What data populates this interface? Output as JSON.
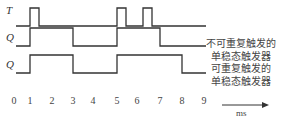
{
  "diagram": {
    "signals": [
      {
        "name": "T",
        "pulses": [
          [
            1,
            1.4
          ],
          [
            5,
            5.4
          ],
          [
            6.2,
            6.6
          ]
        ]
      },
      {
        "name": "Q",
        "pulses": [
          [
            1,
            3
          ],
          [
            5,
            7
          ]
        ],
        "caption": [
          "不可重复触发的",
          "单稳态触发器"
        ]
      },
      {
        "name": "Q",
        "pulses": [
          [
            1,
            3
          ],
          [
            5,
            8
          ]
        ],
        "caption": [
          "可重复触发的",
          "单稳态触发器"
        ]
      }
    ],
    "axis": {
      "ticks": [
        "0",
        "1",
        "2",
        "3",
        "4",
        "5",
        "6",
        "7",
        "8",
        "9"
      ],
      "unit": "ms"
    },
    "colors": {
      "line": "#333333"
    }
  }
}
